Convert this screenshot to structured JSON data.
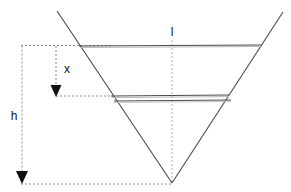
{
  "diagram": {
    "background_color": "#ffffff",
    "stroke_color": "#4a4a4a",
    "light_stroke_color": "#9a9a9a",
    "dashed_color": "#8a8a8a",
    "arrow_color": "#111111",
    "label_color": "#111111",
    "labels": {
      "top_width": "l",
      "partial_depth": "x",
      "total_depth": "h"
    },
    "label_positions": {
      "top_width": {
        "x": 172,
        "y": 33
      },
      "partial_depth": {
        "x": 67,
        "y": 70
      },
      "total_depth": {
        "x": 13,
        "y": 117
      }
    },
    "geometry": {
      "vee_left_leg": {
        "x1": 57,
        "y1": 11,
        "x2": 172,
        "y2": 183
      },
      "vee_right_leg": {
        "x1": 172,
        "y1": 183,
        "x2": 283,
        "y2": 12
      },
      "top_surface_line": {
        "x1": 79,
        "y1": 46,
        "x2": 262,
        "y2": 45
      },
      "inner_surface_line_upper": {
        "x1": 111,
        "y1": 96,
        "x2": 229,
        "y2": 95
      },
      "inner_surface_line_lower": {
        "x1": 113,
        "y1": 101,
        "x2": 231,
        "y2": 100
      },
      "center_dashed_line": {
        "x1": 172,
        "y1": 40,
        "x2": 172,
        "y2": 183
      },
      "h_dim_vertical": {
        "x": 22,
        "y_top": 45,
        "y_bottom": 183
      },
      "h_dim_top_tick": {
        "x1": 22,
        "y1": 45,
        "x2": 113,
        "y2": 45
      },
      "h_dim_bottom_tick": {
        "x1": 22,
        "y1": 184,
        "x2": 172,
        "y2": 184
      },
      "x_dim_vertical": {
        "x": 56,
        "y_top": 46,
        "y_bottom": 96
      },
      "x_dim_bottom_tick": {
        "x1": 56,
        "y1": 96,
        "x2": 113,
        "y2": 96
      },
      "arrow_x_tip": {
        "x": 56,
        "y": 96
      },
      "arrow_h_tip": {
        "x": 22,
        "y": 183
      }
    }
  }
}
